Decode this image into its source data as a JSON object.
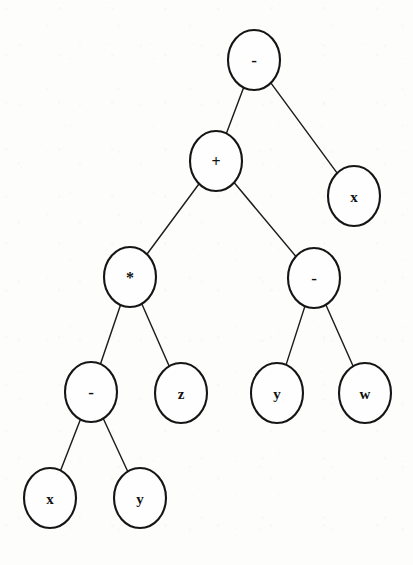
{
  "diagram": {
    "type": "binary-expression-tree",
    "background_color": "#fdfdfc",
    "node_fill": "#fefefe",
    "node_stroke": "#151515",
    "edge_stroke": "#1d1d1d",
    "expression": "((x - y) * z + (y - w)) - x",
    "node_shape": "ellipse",
    "node_rx": 26,
    "node_ry": 30
  },
  "nodes": [
    {
      "id": "n1",
      "label": "-",
      "kind": "operator",
      "cx": 254,
      "cy": 60,
      "level": 0,
      "name": "root-minus"
    },
    {
      "id": "n2",
      "label": "+",
      "kind": "operator",
      "cx": 216,
      "cy": 161,
      "level": 1,
      "name": "plus"
    },
    {
      "id": "n3",
      "label": "x",
      "kind": "operand",
      "cx": 354,
      "cy": 196,
      "level": 1,
      "name": "leaf-x-right"
    },
    {
      "id": "n4",
      "label": "*",
      "kind": "operator",
      "cx": 130,
      "cy": 277,
      "level": 2,
      "name": "times"
    },
    {
      "id": "n5",
      "label": "-",
      "kind": "operator",
      "cx": 314,
      "cy": 278,
      "level": 2,
      "name": "minus-right"
    },
    {
      "id": "n6",
      "label": "-",
      "kind": "operator",
      "cx": 91,
      "cy": 392,
      "level": 3,
      "name": "minus-left"
    },
    {
      "id": "n7",
      "label": "z",
      "kind": "operand",
      "cx": 181,
      "cy": 393,
      "level": 3,
      "name": "leaf-z"
    },
    {
      "id": "n8",
      "label": "y",
      "kind": "operand",
      "cx": 277,
      "cy": 393,
      "level": 3,
      "name": "leaf-y-right"
    },
    {
      "id": "n9",
      "label": "w",
      "kind": "operand",
      "cx": 365,
      "cy": 393,
      "level": 3,
      "name": "leaf-w"
    },
    {
      "id": "n10",
      "label": "x",
      "kind": "operand",
      "cx": 50,
      "cy": 498,
      "level": 4,
      "name": "leaf-x-bottom"
    },
    {
      "id": "n11",
      "label": "y",
      "kind": "operand",
      "cx": 140,
      "cy": 498,
      "level": 4,
      "name": "leaf-y-bottom"
    }
  ],
  "edges": [
    {
      "from": "n1",
      "to": "n2",
      "name": "edge-root-to-plus"
    },
    {
      "from": "n1",
      "to": "n3",
      "name": "edge-root-to-x"
    },
    {
      "from": "n2",
      "to": "n4",
      "name": "edge-plus-to-times"
    },
    {
      "from": "n2",
      "to": "n5",
      "name": "edge-plus-to-minus"
    },
    {
      "from": "n4",
      "to": "n6",
      "name": "edge-times-to-minus"
    },
    {
      "from": "n4",
      "to": "n7",
      "name": "edge-times-to-z"
    },
    {
      "from": "n5",
      "to": "n8",
      "name": "edge-minus-to-y"
    },
    {
      "from": "n5",
      "to": "n9",
      "name": "edge-minus-to-w"
    },
    {
      "from": "n6",
      "to": "n10",
      "name": "edge-minus-to-x"
    },
    {
      "from": "n6",
      "to": "n11",
      "name": "edge-minus-to-y-bottom"
    }
  ]
}
